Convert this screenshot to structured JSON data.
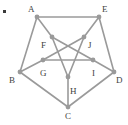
{
  "figure": {
    "background_color": "#ffffff",
    "edge_color": "#9a9a9a",
    "node_color": "#9a9a9a",
    "label_color": "#3f3f3f",
    "edge_width": 1.6,
    "node_radius": 2.4,
    "width": 128,
    "height": 125
  },
  "bullet": {
    "name": "list-bullet",
    "x": 3,
    "y": 10,
    "color": "#3a3a3a"
  },
  "graph_data": {
    "type": "graph",
    "layout": "outer-pentagon-inner-pentagram",
    "node_count": 10,
    "edge_count": 15,
    "nodes": [
      {
        "id": "A",
        "label": "A",
        "x": 37,
        "y": 17,
        "ring": "outer",
        "label_dx": -9,
        "label_dy": -12
      },
      {
        "id": "E",
        "label": "E",
        "x": 99,
        "y": 17,
        "ring": "outer",
        "label_dx": 3,
        "label_dy": -12
      },
      {
        "id": "D",
        "label": "D",
        "x": 114,
        "y": 72,
        "ring": "outer",
        "label_dx": 2,
        "label_dy": 4
      },
      {
        "id": "C",
        "label": "C",
        "x": 68,
        "y": 107,
        "ring": "outer",
        "label_dx": -3,
        "label_dy": 5
      },
      {
        "id": "B",
        "label": "B",
        "x": 20,
        "y": 72,
        "ring": "outer",
        "label_dx": -11,
        "label_dy": 4
      },
      {
        "id": "F",
        "label": "F",
        "x": 52,
        "y": 37,
        "ring": "inner",
        "label_dx": -11,
        "label_dy": 4
      },
      {
        "id": "J",
        "label": "J",
        "x": 84,
        "y": 37,
        "ring": "inner",
        "label_dx": 4,
        "label_dy": 4
      },
      {
        "id": "I",
        "label": "I",
        "x": 93,
        "y": 60,
        "ring": "inner",
        "label_dx": -1,
        "label_dy": 9
      },
      {
        "id": "H",
        "label": "H",
        "x": 68,
        "y": 77,
        "ring": "inner",
        "label_dx": 2,
        "label_dy": 10
      },
      {
        "id": "G",
        "label": "G",
        "x": 43,
        "y": 60,
        "ring": "inner",
        "label_dx": -3,
        "label_dy": 9
      }
    ],
    "edges": [
      {
        "from": "A",
        "to": "E",
        "group": "outer"
      },
      {
        "from": "E",
        "to": "D",
        "group": "outer"
      },
      {
        "from": "D",
        "to": "C",
        "group": "outer"
      },
      {
        "from": "C",
        "to": "B",
        "group": "outer"
      },
      {
        "from": "B",
        "to": "A",
        "group": "outer"
      },
      {
        "from": "A",
        "to": "F",
        "group": "spoke"
      },
      {
        "from": "E",
        "to": "J",
        "group": "spoke"
      },
      {
        "from": "D",
        "to": "I",
        "group": "spoke"
      },
      {
        "from": "C",
        "to": "H",
        "group": "spoke"
      },
      {
        "from": "B",
        "to": "G",
        "group": "spoke"
      },
      {
        "from": "F",
        "to": "I",
        "group": "pentagram"
      },
      {
        "from": "I",
        "to": "G",
        "group": "pentagram"
      },
      {
        "from": "G",
        "to": "J",
        "group": "pentagram"
      },
      {
        "from": "J",
        "to": "H",
        "group": "pentagram"
      },
      {
        "from": "H",
        "to": "F",
        "group": "pentagram"
      }
    ]
  }
}
